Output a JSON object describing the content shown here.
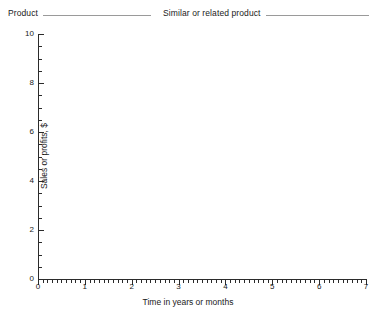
{
  "header": {
    "fields": [
      {
        "label": "Product",
        "value": ""
      },
      {
        "label": "Similar or related product",
        "value": ""
      }
    ]
  },
  "chart_data": {
    "type": "line",
    "title": "",
    "xlabel": "Time in years or months",
    "ylabel": "Sales or profits, $",
    "xlim": [
      0,
      7
    ],
    "ylim": [
      0,
      10
    ],
    "x_major_ticks": [
      0,
      1,
      2,
      3,
      4,
      5,
      6,
      7
    ],
    "x_tick_labels": [
      "0",
      "1",
      "2",
      "3",
      "4",
      "5",
      "6",
      "7"
    ],
    "x_minor_tick_step": 0.1,
    "y_major_ticks": [
      0,
      2,
      4,
      6,
      8,
      10
    ],
    "y_tick_labels": [
      "0",
      "2",
      "4",
      "6",
      "8",
      "10"
    ],
    "y_minor_tick_step": 0.5,
    "grid": false,
    "legend": null,
    "series": [],
    "annotations": []
  }
}
